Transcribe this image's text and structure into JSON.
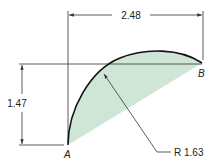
{
  "diagram": {
    "type": "engineering-drawing",
    "points": {
      "a": "A",
      "b": "B"
    },
    "dimensions": {
      "horizontal": "2.48",
      "vertical": "1.47",
      "radius": "R 1.63"
    },
    "colors": {
      "fill": "#cfe6d6",
      "arc": "#111111",
      "lines": "#333333",
      "text": "#222222"
    }
  }
}
